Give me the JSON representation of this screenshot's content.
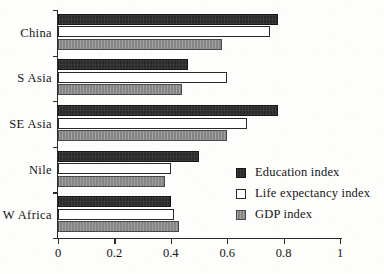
{
  "chart_data": {
    "type": "bar",
    "orientation": "horizontal",
    "title": "",
    "subtitle": "",
    "xlabel": "",
    "ylabel": "",
    "xlim": [
      0,
      1
    ],
    "xticks": [
      0,
      0.2,
      0.4,
      0.6,
      0.8,
      1
    ],
    "xticklabels": [
      "0",
      "0.2",
      "0.4",
      "0.6",
      "0.8",
      "1"
    ],
    "grid": false,
    "legend_position": "inside-lower-right",
    "categories": [
      "China",
      "S Asia",
      "SE Asia",
      "Nile",
      "W Africa"
    ],
    "series": [
      {
        "name": "Education index",
        "color": "#2a2a2a",
        "style": "solid-dark",
        "values": [
          0.78,
          0.46,
          0.78,
          0.5,
          0.4
        ]
      },
      {
        "name": "Life expectancy index",
        "color": "#ffffff",
        "style": "white-outline",
        "values": [
          0.75,
          0.6,
          0.67,
          0.4,
          0.41
        ]
      },
      {
        "name": "GDP index",
        "color": "#8c8c8c",
        "style": "gray",
        "values": [
          0.58,
          0.44,
          0.6,
          0.38,
          0.43
        ]
      }
    ],
    "annotations": []
  },
  "legend": {
    "items": [
      {
        "label": "Education index",
        "swatch": "education"
      },
      {
        "label": "Life expectancy index",
        "swatch": "lifeexp"
      },
      {
        "label": "GDP index",
        "swatch": "gdp"
      }
    ]
  },
  "axis": {
    "x_tick_labels": [
      "0",
      "0.2",
      "0.4",
      "0.6",
      "0.8",
      "1"
    ],
    "y_category_labels": [
      "China",
      "S Asia",
      "SE Asia",
      "Nile",
      "W Africa"
    ]
  }
}
